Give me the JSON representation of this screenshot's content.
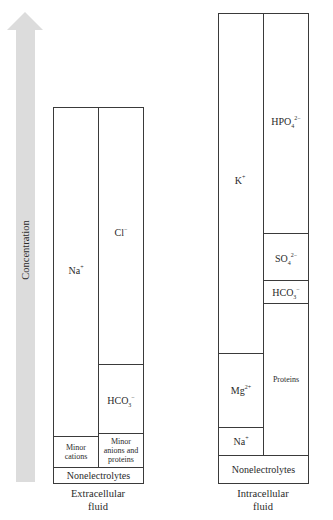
{
  "axis": {
    "label": "Concentration",
    "arrow_color": "#dcdcdc"
  },
  "extracellular": {
    "caption_line1": "Extracellular",
    "caption_line2": "fluid",
    "cations": {
      "na": {
        "base": "Na",
        "sup": "+"
      },
      "minor": {
        "line1": "Minor",
        "line2": "cations"
      }
    },
    "anions": {
      "cl": {
        "base": "Cl",
        "sup": "−"
      },
      "hco3": {
        "base": "HCO",
        "sub": "3",
        "sup": "−"
      },
      "minor": {
        "line1": "Minor",
        "line2": "anions and",
        "line3": "proteins"
      }
    },
    "nonelectrolytes": "Nonelectrolytes"
  },
  "intracellular": {
    "caption_line1": "Intracellular",
    "caption_line2": "fluid",
    "cations": {
      "k": {
        "base": "K",
        "sup": "+"
      },
      "mg": {
        "base": "Mg",
        "sup": "2+"
      },
      "na": {
        "base": "Na",
        "sup": "+"
      }
    },
    "anions": {
      "hpo4": {
        "base": "HPO",
        "sub": "4",
        "sup": "2−"
      },
      "so4": {
        "base": "SO",
        "sub": "4",
        "sup": "2−"
      },
      "hco3": {
        "base": "HCO",
        "sub": "3",
        "sup": "−"
      },
      "proteins": "Proteins"
    },
    "nonelectrolytes": "Nonelectrolytes"
  }
}
